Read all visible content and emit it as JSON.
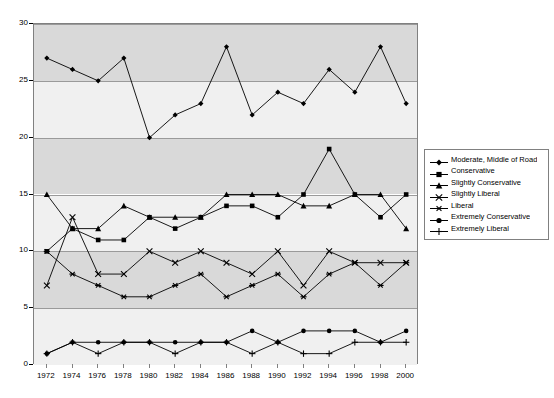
{
  "chart_data": {
    "type": "line",
    "title": "",
    "xlabel": "",
    "ylabel": "",
    "xlim": [
      1972,
      2000
    ],
    "ylim": [
      0,
      30
    ],
    "ytick_values": [
      0,
      5,
      10,
      15,
      20,
      25,
      30
    ],
    "grid": true,
    "legend_position": "right",
    "categories": [
      1972,
      1974,
      1976,
      1978,
      1980,
      1982,
      1984,
      1986,
      1988,
      1990,
      1992,
      1994,
      1996,
      1998,
      2000
    ],
    "xtick_labels": [
      "1972",
      "1974",
      "1976",
      "1978",
      "1980",
      "1982",
      "1984",
      "1986",
      "1988",
      "1990",
      "1992",
      "1994",
      "1996",
      "1998",
      "2000"
    ],
    "ytick_labels": [
      "0",
      "5",
      "10",
      "15",
      "20",
      "25",
      "30"
    ],
    "series": [
      {
        "name": "Moderate, Middle of Road",
        "marker": "diamond",
        "values": [
          27,
          26,
          25,
          27,
          20,
          22,
          23,
          28,
          22,
          24,
          23,
          26,
          24,
          28,
          23
        ]
      },
      {
        "name": "Conservative",
        "marker": "square",
        "values": [
          10,
          12,
          11,
          11,
          13,
          12,
          13,
          14,
          14,
          13,
          15,
          19,
          15,
          13,
          15
        ]
      },
      {
        "name": "Slightly Conservative",
        "marker": "triangle",
        "values": [
          15,
          12,
          12,
          14,
          13,
          13,
          13,
          15,
          15,
          15,
          14,
          14,
          15,
          15,
          12
        ]
      },
      {
        "name": "Slightly Liberal",
        "marker": "cross",
        "values": [
          7,
          13,
          8,
          8,
          10,
          9,
          10,
          9,
          8,
          10,
          7,
          10,
          9,
          9,
          9
        ]
      },
      {
        "name": "Liberal",
        "marker": "asterisk",
        "values": [
          10,
          8,
          7,
          6,
          6,
          7,
          8,
          6,
          7,
          8,
          6,
          8,
          9,
          7,
          9
        ]
      },
      {
        "name": "Extremely Conservative",
        "marker": "circle",
        "values": [
          1,
          2,
          2,
          2,
          2,
          2,
          2,
          2,
          3,
          2,
          3,
          3,
          3,
          2,
          3
        ]
      },
      {
        "name": "Extremely Liberal",
        "marker": "plus",
        "values": [
          1,
          2,
          1,
          2,
          2,
          1,
          2,
          2,
          1,
          2,
          1,
          1,
          2,
          2,
          2
        ]
      }
    ]
  },
  "legend": {
    "items": [
      "Moderate, Middle of Road",
      "Conservative",
      "Slightly Conservative",
      "Slightly Liberal",
      "Liberal",
      "Extremely Conservative",
      "Extremely Liberal"
    ]
  },
  "colors": {
    "series_line": "#000000",
    "plot_band_dark": "#d9d9d9",
    "plot_band_light": "#f0f0f0",
    "gridline": "#9a9a9a",
    "axis": "#808080",
    "background": "#ffffff"
  }
}
